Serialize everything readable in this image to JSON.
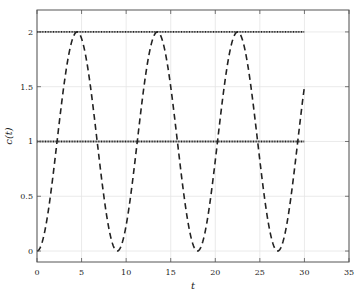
{
  "chart_data": {
    "type": "line",
    "title": "",
    "xlabel": "t",
    "ylabel": "c(t)",
    "xlim": [
      0,
      35
    ],
    "ylim": [
      -0.1,
      2.2
    ],
    "xticks": [
      0,
      5,
      10,
      15,
      20,
      25,
      30,
      35
    ],
    "yticks": [
      0,
      0.5,
      1,
      1.5,
      2
    ],
    "xtick_labels": [
      "0",
      "5",
      "10",
      "15",
      "20",
      "25",
      "30",
      "35"
    ],
    "ytick_labels": [
      "0",
      "0.5",
      "1",
      "1.5",
      "2"
    ],
    "grid": true,
    "legend": null,
    "series": [
      {
        "name": "c(t)",
        "style": "dashed",
        "color": "#222222",
        "description": "oscillating response, approx. 1 - cos(2*pi*t/9)",
        "x": [
          0,
          2.25,
          4.5,
          6.75,
          9,
          11.25,
          13.5,
          15.75,
          18,
          20.25,
          22.5,
          24.75,
          27,
          29.25,
          30
        ],
        "values": [
          0,
          1.0,
          2.0,
          1.0,
          0,
          1.0,
          2.0,
          1.0,
          0,
          1.0,
          2.0,
          1.0,
          0,
          1.0,
          1.5
        ]
      },
      {
        "name": "upper bound",
        "style": "dotted",
        "color": "#222222",
        "x": [
          0,
          30
        ],
        "values": [
          2,
          2
        ]
      },
      {
        "name": "steady-state value",
        "style": "dotted",
        "color": "#222222",
        "x": [
          0,
          30
        ],
        "values": [
          1,
          1
        ]
      }
    ],
    "period": 9,
    "t_end": 30
  }
}
